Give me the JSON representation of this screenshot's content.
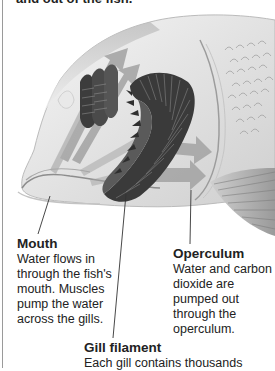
{
  "caption": {
    "top_text": "and out of the fish."
  },
  "figure": {
    "icons": [
      "fish-head-illustration",
      "gill-arch-icon",
      "water-flow-arrow-icon",
      "scales-icon",
      "pectoral-fin-icon"
    ]
  },
  "labels": {
    "mouth": {
      "title": "Mouth",
      "body": "Water flows in through the fish's mouth. Muscles pump the water across the gills."
    },
    "operculum": {
      "title": "Operculum",
      "body": "Water and carbon dioxide are pumped out through the operculum."
    },
    "gill_filament": {
      "title": "Gill filament",
      "body": "Each gill contains thousands"
    }
  },
  "colors": {
    "background": "#ffffff",
    "text": "#222222",
    "gill_dark": "#3a3a3a",
    "arrow_gray": "#a8a8a8",
    "fish_body": "#e4e4e4",
    "leader_line": "#333333"
  }
}
